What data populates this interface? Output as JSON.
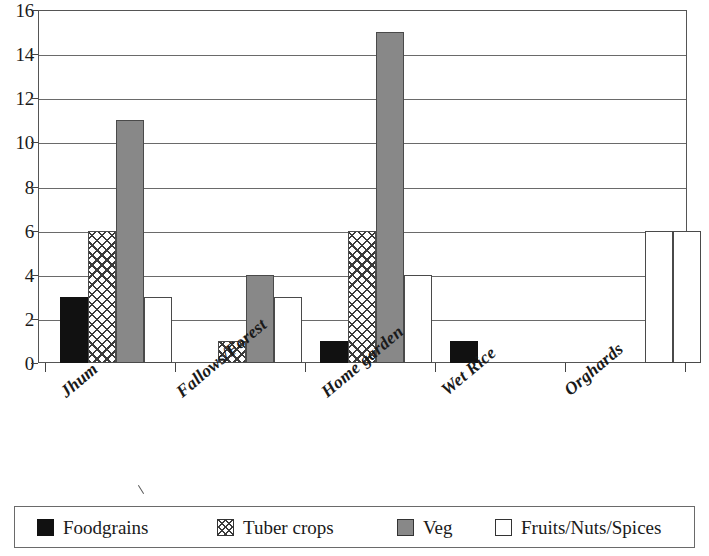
{
  "chart_data": {
    "type": "bar",
    "title": "",
    "xlabel": "",
    "ylabel": "",
    "ylim": [
      0,
      16
    ],
    "ytick_step": 2,
    "yticks": [
      0,
      2,
      4,
      6,
      8,
      10,
      12,
      14,
      16
    ],
    "ytick_labels": [
      "0",
      "2",
      "4",
      "6",
      "8",
      "10",
      "12",
      "14",
      "16"
    ],
    "grid": true,
    "grid_axis": "y",
    "legend_position": "bottom",
    "categories": [
      "Jhum",
      "Fallows/Forest",
      "Home garden",
      "Wet Rice",
      "Orghards"
    ],
    "series": [
      {
        "name": "Foodgrains",
        "key": "foodgrains",
        "color": "#111111",
        "fill": "solid-black",
        "values": [
          3,
          0,
          1,
          1,
          0
        ]
      },
      {
        "name": "Tuber crops",
        "key": "tuber",
        "color": "#3b3b3b",
        "fill": "crosshatch",
        "values": [
          6,
          1,
          6,
          0,
          0
        ]
      },
      {
        "name": "Veg",
        "key": "veg",
        "color": "#888888",
        "fill": "solid-gray",
        "values": [
          11,
          4,
          15,
          0,
          0
        ]
      },
      {
        "name": "Fruits/Nuts/Spices",
        "key": "fruits",
        "color": "#ffffff",
        "fill": "solid-white",
        "values": [
          3,
          3,
          4,
          0,
          6
        ]
      }
    ],
    "extra_bars": [
      {
        "series": "Fruits/Nuts/Spices",
        "value": 6,
        "note": "clipped bar at right edge"
      }
    ]
  },
  "axes": {
    "y_labels": [
      {
        "text": "16",
        "value": 16
      },
      {
        "text": "14",
        "value": 14
      },
      {
        "text": "12",
        "value": 12
      },
      {
        "text": "10",
        "value": 10
      },
      {
        "text": "8",
        "value": 8
      },
      {
        "text": "6",
        "value": 6
      },
      {
        "text": "4",
        "value": 4
      },
      {
        "text": "2",
        "value": 2
      },
      {
        "text": "0",
        "value": 0
      }
    ],
    "x_labels": [
      {
        "text": "Jhum",
        "left": 56,
        "top": 14
      },
      {
        "text": "Fallows/Forest",
        "left": 172,
        "top": 14
      },
      {
        "text": "Home garden",
        "left": 317,
        "top": 14
      },
      {
        "text": "Wet Rice",
        "left": 437,
        "top": 12
      },
      {
        "text": "Orghards",
        "left": 560,
        "top": 12
      }
    ]
  },
  "legend": {
    "items": [
      {
        "label": "Foodgrains",
        "key": "foodgrains",
        "left": 22
      },
      {
        "label": "Tuber crops",
        "key": "tuber",
        "left": 202
      },
      {
        "label": "Veg",
        "key": "veg",
        "left": 382
      },
      {
        "label": "Fruits/Nuts/Spices",
        "key": "fruits",
        "left": 480
      }
    ]
  },
  "bar_layout": {
    "plot_width": 649,
    "plot_height": 353,
    "bar_width": 28,
    "groups": [
      {
        "category": "Jhum",
        "tick_x": 7,
        "bars_left": [
          22,
          50,
          78,
          106
        ]
      },
      {
        "category": "Fallows/Forest",
        "tick_x": 137,
        "bars_left": [
          152,
          180,
          208,
          236
        ]
      },
      {
        "category": "Home garden",
        "tick_x": 267,
        "bars_left": [
          282,
          310,
          338,
          366
        ]
      },
      {
        "category": "Wet Rice",
        "tick_x": 397,
        "bars_left": [
          412,
          440,
          468,
          496
        ]
      },
      {
        "category": "Orghards",
        "tick_x": 527,
        "bars_left": [
          542,
          570,
          598,
          607
        ]
      }
    ],
    "clipped_bar_left": 635
  }
}
